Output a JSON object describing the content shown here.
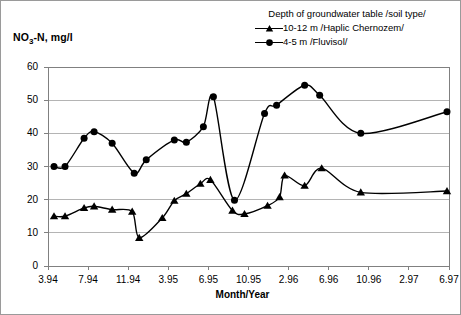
{
  "figure": {
    "ylabel": "NO3-N, mg/l",
    "ylabel_base": "NO",
    "ylabel_sub": "3",
    "ylabel_rest": "-N, mg/l",
    "xlabel": "Month/Year"
  },
  "legend": {
    "title": "Depth of groundwater table /soil type/",
    "entries": [
      {
        "marker": "triangle-marker",
        "label": "10-12 m /Haplic Chernozem/"
      },
      {
        "marker": "circle-marker",
        "label": "4-5 m /Fluvisol/"
      }
    ]
  },
  "colors": {
    "series": "#000000",
    "grid": "#b4b4b4",
    "axis": "#808080",
    "border": "#9a9a9a",
    "background": "#ffffff"
  },
  "chart_data": {
    "type": "line",
    "title": "",
    "xlabel": "Month/Year",
    "ylabel": "NO3-N, mg/l",
    "ylim": [
      0,
      60
    ],
    "yticks": [
      0,
      10,
      20,
      30,
      40,
      50,
      60
    ],
    "xticks": [
      "3.94",
      "7.94",
      "11.94",
      "3.95",
      "6.95",
      "10.95",
      "2.96",
      "6.96",
      "10.96",
      "2.97",
      "6.97"
    ],
    "grid": true,
    "legend_position": "top-right",
    "x_index_range": [
      0,
      40
    ],
    "xtick_indices": [
      0,
      4,
      8,
      12,
      16,
      20,
      24,
      28,
      32,
      36,
      40
    ],
    "series": [
      {
        "name": "10-12 m /Haplic Chernozem/",
        "marker": "triangle",
        "points": [
          {
            "x": 0.6,
            "y": 15.0
          },
          {
            "x": 1.7,
            "y": 15.0
          },
          {
            "x": 3.6,
            "y": 17.5
          },
          {
            "x": 4.6,
            "y": 18.0
          },
          {
            "x": 6.4,
            "y": 17.0
          },
          {
            "x": 8.4,
            "y": 16.4
          },
          {
            "x": 9.1,
            "y": 8.5
          },
          {
            "x": 11.4,
            "y": 14.5
          },
          {
            "x": 12.6,
            "y": 19.7
          },
          {
            "x": 13.8,
            "y": 21.8
          },
          {
            "x": 15.2,
            "y": 24.8
          },
          {
            "x": 16.2,
            "y": 26.0
          },
          {
            "x": 18.4,
            "y": 16.7
          },
          {
            "x": 19.6,
            "y": 15.7
          },
          {
            "x": 21.9,
            "y": 18.2
          },
          {
            "x": 23.1,
            "y": 20.8
          },
          {
            "x": 23.6,
            "y": 27.3
          },
          {
            "x": 25.6,
            "y": 24.2
          },
          {
            "x": 27.3,
            "y": 29.5
          },
          {
            "x": 31.2,
            "y": 22.2
          },
          {
            "x": 39.8,
            "y": 22.6
          }
        ]
      },
      {
        "name": "4-5 m /Fluvisol/",
        "marker": "circle",
        "points": [
          {
            "x": 0.6,
            "y": 30.0
          },
          {
            "x": 1.7,
            "y": 30.0
          },
          {
            "x": 3.6,
            "y": 38.5
          },
          {
            "x": 4.6,
            "y": 40.5
          },
          {
            "x": 6.4,
            "y": 37.0
          },
          {
            "x": 8.6,
            "y": 28.0
          },
          {
            "x": 9.8,
            "y": 32.0
          },
          {
            "x": 12.6,
            "y": 38.0
          },
          {
            "x": 13.8,
            "y": 37.3
          },
          {
            "x": 15.5,
            "y": 42.0
          },
          {
            "x": 16.5,
            "y": 51.0
          },
          {
            "x": 18.6,
            "y": 19.8
          },
          {
            "x": 21.6,
            "y": 46.0
          },
          {
            "x": 22.8,
            "y": 48.5
          },
          {
            "x": 25.6,
            "y": 54.5
          },
          {
            "x": 27.1,
            "y": 51.5
          },
          {
            "x": 31.2,
            "y": 40.0
          },
          {
            "x": 39.8,
            "y": 46.5
          }
        ]
      }
    ]
  }
}
